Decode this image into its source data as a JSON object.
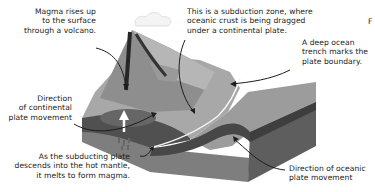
{
  "diagram": {
    "type": "subduction-zone-cross-section",
    "labels": {
      "magma_rises": "Magma rises up\nto the surface\nthrough a volcano.",
      "subduction_zone": "This is a subduction zone, where\noceanic crust is being dragged\nunder a continental plate.",
      "trench": "A deep ocean\ntrench marks the\nplate boundary.",
      "continental_direction": "Direction\nof continental\nplate movement",
      "subducting_melts": "As the subducting plate\ndescends into the hot mantle,\nit melts to form magma.",
      "oceanic_direction": "Direction of oceanic\nplate movement",
      "edge_fragment": "F"
    },
    "colors": {
      "text": "#222222",
      "arrow": "#1e1e1e",
      "continent_top": "#a9a9a9",
      "volcano_light": "#b3b3b3",
      "volcano_dark": "#8c8c8c",
      "ocean_top": "#9a9a9a",
      "crust_band": "#4a4a4a",
      "mantle_front": "#7a7a7a",
      "side_dark": "#5f5f5f",
      "trench_line": "#f2f2f2"
    }
  }
}
